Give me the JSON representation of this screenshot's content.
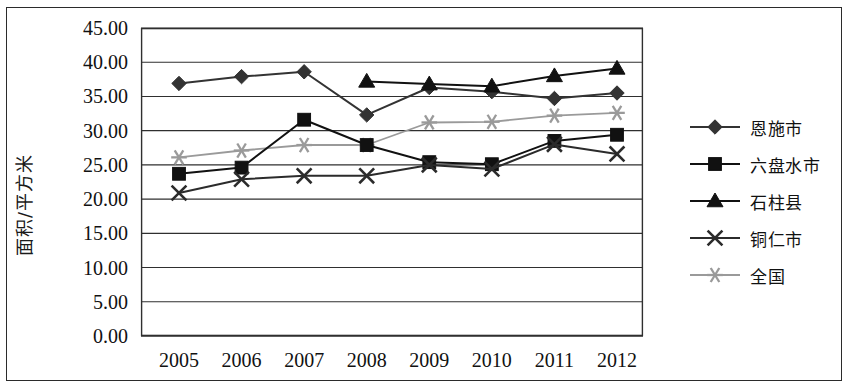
{
  "chart_data": {
    "type": "line",
    "title": "",
    "subtitle": "",
    "xlabel": "",
    "ylabel": "面积/平方米",
    "categories": [
      "2005",
      "2006",
      "2007",
      "2008",
      "2009",
      "2010",
      "2011",
      "2012"
    ],
    "x": [
      2005,
      2006,
      2007,
      2008,
      2009,
      2010,
      2011,
      2012
    ],
    "ylim": [
      0,
      45
    ],
    "ytick_labels": [
      "0.00",
      "5.00",
      "10.00",
      "15.00",
      "20.00",
      "25.00",
      "30.00",
      "35.00",
      "40.00",
      "45.00"
    ],
    "ytick_values": [
      0,
      5,
      10,
      15,
      20,
      25,
      30,
      35,
      40,
      45
    ],
    "ytick_step": 5,
    "grid": "horizontal",
    "legend_position": "right",
    "series": [
      {
        "name": "恩施市",
        "marker": "diamond",
        "color": "#333333",
        "values": [
          36.9,
          37.9,
          38.6,
          32.3,
          36.3,
          35.7,
          34.7,
          35.5
        ]
      },
      {
        "name": "六盘水市",
        "marker": "square",
        "color": "#111111",
        "values": [
          23.7,
          24.6,
          31.6,
          27.9,
          25.4,
          25.1,
          28.5,
          29.4
        ]
      },
      {
        "name": "石柱县",
        "marker": "triangle",
        "color": "#111111",
        "values": [
          null,
          null,
          null,
          37.2,
          36.8,
          36.5,
          38.0,
          39.1
        ]
      },
      {
        "name": "铜仁市",
        "marker": "x",
        "color": "#2b2b2b",
        "values": [
          20.9,
          22.9,
          23.4,
          23.4,
          25.0,
          24.4,
          28.0,
          26.6
        ]
      },
      {
        "name": "全国",
        "marker": "asterisk",
        "color": "#9a9a9a",
        "values": [
          26.1,
          27.1,
          27.9,
          27.9,
          31.2,
          31.3,
          32.2,
          32.6
        ]
      }
    ]
  }
}
